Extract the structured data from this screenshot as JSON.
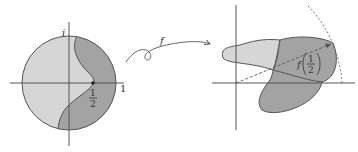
{
  "diagram": {
    "title": "",
    "left_figure": {
      "name": "unit-disk-domain",
      "labels": {
        "imag_unit": "i",
        "real_one": "1",
        "half_num": "1",
        "half_den": "2"
      },
      "colors": {
        "light_region": "#d6d6d6",
        "dark_region": "#a3a3a3",
        "outline": "#555555"
      }
    },
    "mapping_arrow": {
      "label": "f"
    },
    "right_figure": {
      "name": "image-region",
      "labels": {
        "func": "f",
        "half_num": "1",
        "half_den": "2"
      },
      "colors": {
        "light_region": "#d6d6d6",
        "dark_region": "#a3a3a3",
        "outline": "#555555"
      }
    }
  }
}
